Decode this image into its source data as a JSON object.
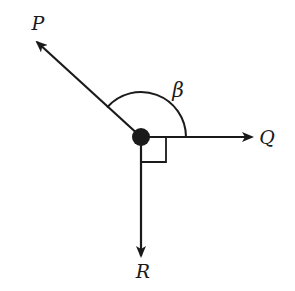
{
  "diagram": {
    "type": "vector-forces",
    "colors": {
      "stroke": "#1a1a1a",
      "background": "#ffffff"
    },
    "origin": {
      "x": 141,
      "y": 137,
      "dot_radius": 9
    },
    "vectors": [
      {
        "name": "P",
        "label": "P",
        "direction": "upper-left",
        "tip": {
          "x": 35,
          "y": 40
        },
        "label_pos": {
          "x": 38,
          "y": 30
        }
      },
      {
        "name": "Q",
        "label": "Q",
        "direction": "right",
        "tip": {
          "x": 252,
          "y": 137
        },
        "label_pos": {
          "x": 266,
          "y": 145
        }
      },
      {
        "name": "R",
        "label": "R",
        "direction": "down",
        "tip": {
          "x": 141,
          "y": 256
        },
        "label_pos": {
          "x": 143,
          "y": 278
        }
      }
    ],
    "angles": [
      {
        "name": "beta",
        "label": "β",
        "between": [
          "P",
          "Q"
        ],
        "marker": "arc",
        "arc_radius": 45,
        "label_pos": {
          "x": 178,
          "y": 97
        }
      },
      {
        "name": "right-angle",
        "label": "",
        "between": [
          "Q",
          "R"
        ],
        "marker": "square",
        "size": 25
      }
    ]
  }
}
